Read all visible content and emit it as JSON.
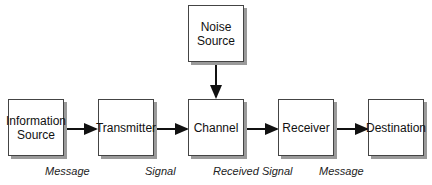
{
  "nodes": {
    "info_source": "Information Source",
    "transmitter": "Transmitter",
    "channel": "Channel",
    "noise": "Noise Source",
    "receiver": "Receiver",
    "destination": "Destination"
  },
  "edge_labels": {
    "message1": "Message",
    "signal": "Signal",
    "received_signal": "Received Signal",
    "message2": "Message"
  }
}
